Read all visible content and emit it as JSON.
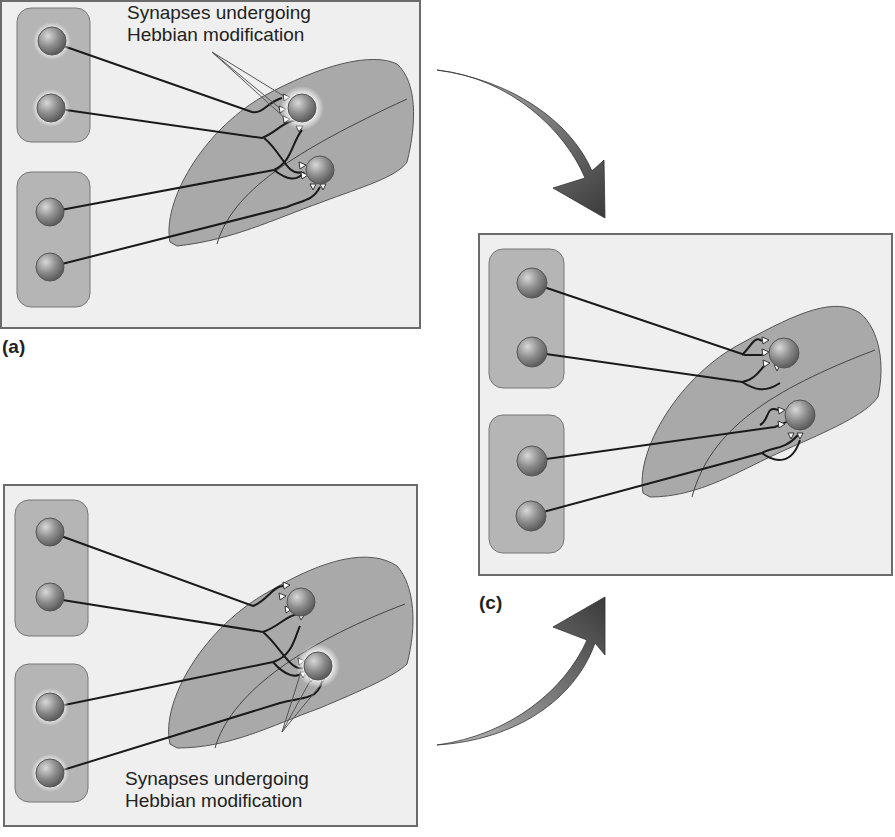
{
  "panels": [
    {
      "id": "a",
      "label": "(a)",
      "caption_line1": "Synapses undergoing",
      "caption_line2": "Hebbian modification",
      "active_neuron": "upper"
    },
    {
      "id": "b",
      "label": "(b)",
      "caption_line1": "Synapses undergoing",
      "caption_line2": "Hebbian modification",
      "active_neuron": "lower"
    },
    {
      "id": "c",
      "label": "(c)",
      "caption_line1": "",
      "caption_line2": "",
      "active_neuron": "none"
    }
  ],
  "colors": {
    "panel_bg": "#efefef",
    "group_fill": "#b5b5b5",
    "region_fill": "#a9a9a9",
    "neuron": "#8a8a8a",
    "axon": "#1a1a1a",
    "arrow": "#555555"
  }
}
